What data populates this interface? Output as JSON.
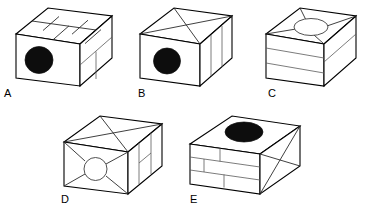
{
  "image": {
    "title": "Five isometric cube puzzle figures",
    "width": 365,
    "height": 214,
    "background_color": "#ffffff",
    "line_color": "#000000",
    "hole_fill_color": "#0d0d0d"
  },
  "figures": [
    {
      "id": "A",
      "label": "A",
      "label_x": 8,
      "label_y": 88,
      "front_face": {
        "pattern": "single-panel",
        "hole": {
          "type": "filled-circle",
          "position": "left-center"
        }
      },
      "top_face": {
        "pattern": "brick-grid",
        "rows": 2,
        "hole": "none"
      },
      "right_face": {
        "pattern": "one-horizontal-one-vertical",
        "hole": "none"
      }
    },
    {
      "id": "B",
      "label": "B",
      "label_x": 138,
      "label_y": 88,
      "front_face": {
        "pattern": "single-panel",
        "hole": {
          "type": "filled-circle",
          "position": "center"
        }
      },
      "top_face": {
        "pattern": "diagonal-cross",
        "hole": "none"
      },
      "right_face": {
        "pattern": "two-vertical-lines",
        "hole": "none"
      }
    },
    {
      "id": "C",
      "label": "C",
      "label_x": 268,
      "label_y": 88,
      "front_face": {
        "pattern": "two-horizontal-bands",
        "hole": "none"
      },
      "top_face": {
        "pattern": "radial-to-corners",
        "hole": {
          "type": "open-circle",
          "position": "center"
        }
      },
      "right_face": {
        "pattern": "one-horizontal-line",
        "hole": "none"
      }
    },
    {
      "id": "D",
      "label": "D",
      "label_x": 63,
      "label_y": 196,
      "front_face": {
        "pattern": "radial-to-corners",
        "hole": {
          "type": "open-circle",
          "position": "center"
        }
      },
      "top_face": {
        "pattern": "diagonal-cross",
        "hole": "none"
      },
      "right_face": {
        "pattern": "two-vertical-one-horizontal",
        "hole": "none"
      }
    },
    {
      "id": "E",
      "label": "E",
      "label_x": 190,
      "label_y": 196,
      "front_face": {
        "pattern": "brick-wall",
        "rows": 3,
        "hole": "none"
      },
      "top_face": {
        "pattern": "plain",
        "hole": {
          "type": "filled-circle",
          "position": "center"
        }
      },
      "right_face": {
        "pattern": "diagonal-cross",
        "hole": "none"
      }
    }
  ]
}
